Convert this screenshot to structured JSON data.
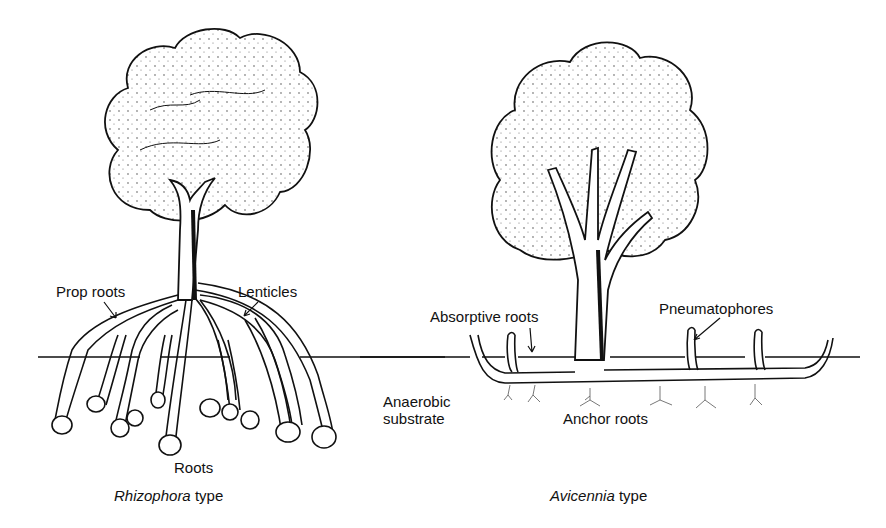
{
  "figure": {
    "left_tree": {
      "caption_genus": "Rhizophora",
      "caption_suffix": " type",
      "labels": {
        "prop_roots": "Prop roots",
        "lenticles": "Lenticles",
        "roots": "Roots"
      }
    },
    "right_tree": {
      "caption_genus": "Avicennia",
      "caption_suffix": " type",
      "labels": {
        "absorptive_roots": "Absorptive roots",
        "pneumatophores": "Pneumatophores",
        "anchor_roots": "Anchor roots"
      }
    },
    "shared_labels": {
      "substrate_line1": "Anaerobic",
      "substrate_line2": "substrate"
    },
    "colors": {
      "ink": "#111111",
      "background": "#ffffff"
    }
  }
}
